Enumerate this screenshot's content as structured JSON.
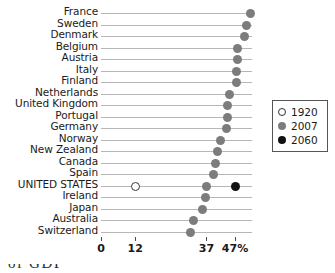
{
  "chart_data": {
    "type": "scatter",
    "title": "",
    "subtitle": "",
    "xlabel": "",
    "ylabel": "",
    "xlim": [
      0,
      50
    ],
    "grid": false,
    "orientation": "horizontal",
    "legend_position": "right",
    "axis": {
      "ticks": [
        {
          "label": "0",
          "value": 0
        },
        {
          "label": "12",
          "value": 12
        },
        {
          "label": "37",
          "value": 37
        },
        {
          "label": "47%",
          "value": 47
        }
      ]
    },
    "legend": [
      {
        "name": "1920",
        "style": "open-circle",
        "color": "#ffffff"
      },
      {
        "name": "2007",
        "style": "filled-circle",
        "color": "#7c7c7c"
      },
      {
        "name": "2060",
        "style": "filled-circle",
        "color": "#111111"
      }
    ],
    "categories": [
      "France",
      "Sweden",
      "Denmark",
      "Belgium",
      "Austria",
      "Italy",
      "Finland",
      "Netherlands",
      "United Kingdom",
      "Portugal",
      "Germany",
      "Norway",
      "New Zealand",
      "Canada",
      "Spain",
      "UNITED STATES",
      "Ireland",
      "Japan",
      "Australia",
      "Switzerland"
    ],
    "series": [
      {
        "name": "1920",
        "values": [
          null,
          null,
          null,
          null,
          null,
          null,
          null,
          null,
          null,
          null,
          null,
          null,
          null,
          null,
          null,
          12,
          null,
          null,
          null,
          null
        ]
      },
      {
        "name": "2007",
        "values": [
          52.5,
          51,
          50.5,
          48,
          48,
          47.5,
          47.5,
          45,
          44.5,
          44.5,
          44,
          42,
          41,
          40,
          39.5,
          37,
          36.5,
          35.5,
          32.5,
          31.5
        ]
      },
      {
        "name": "2060",
        "values": [
          null,
          null,
          null,
          null,
          null,
          null,
          null,
          null,
          null,
          null,
          null,
          null,
          null,
          null,
          null,
          47,
          null,
          null,
          null,
          null
        ]
      }
    ]
  },
  "caption": {
    "partial_text": "of GDP"
  }
}
